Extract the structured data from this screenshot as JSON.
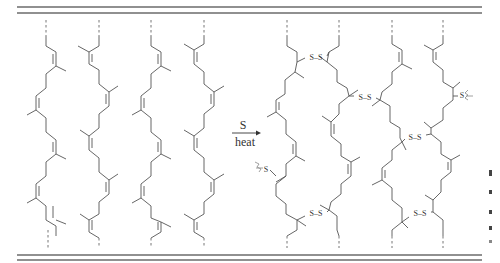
{
  "figure": {
    "reaction_arrow": {
      "reagent_above": "S",
      "condition_below": "heat"
    },
    "left_panel": {
      "label": "polyisoprene chains",
      "chain_count": 4
    },
    "right_panel": {
      "label": "cross-linked chains",
      "chain_count": 4,
      "bridge_label": "S–S",
      "atom_label": "S",
      "bridges": [
        {
          "between": "chain-1-chain-2",
          "label": "S–S"
        },
        {
          "between": "chain-2-chain-3",
          "label": "S–S"
        },
        {
          "between": "chain-3-chain-4",
          "label": "S–S"
        },
        {
          "between": "chain-1-chain-2-lower",
          "label": "S–S"
        },
        {
          "between": "chain-3-chain-4-lower",
          "label": "S–S"
        }
      ],
      "terminal_S": [
        {
          "position": "left",
          "label": "S"
        },
        {
          "position": "right",
          "label": "S"
        }
      ]
    },
    "colors": {
      "rule": "#222222",
      "bond": "#555555",
      "text": "#333333",
      "wavy": "#888888"
    }
  }
}
